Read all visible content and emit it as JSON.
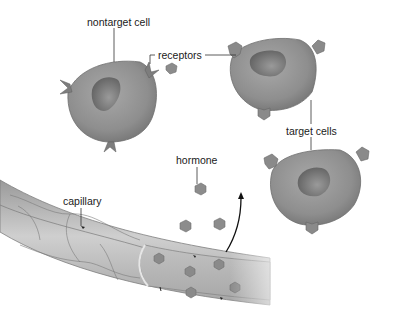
{
  "labels": {
    "nontarget_cell": "nontarget cell",
    "receptors": "receptors",
    "target_cells": "target cells",
    "hormone": "hormone",
    "capillary": "capillary"
  },
  "colors": {
    "cell_fill": "#8f8f8f",
    "cell_edge": "#6d6d6d",
    "nucleus": "#707070",
    "receptor": "#8a8a8a",
    "hormone": "#8c8c8c",
    "capillary": "#b8b8b8",
    "leader_line": "#333333",
    "arrow": "#111111"
  }
}
